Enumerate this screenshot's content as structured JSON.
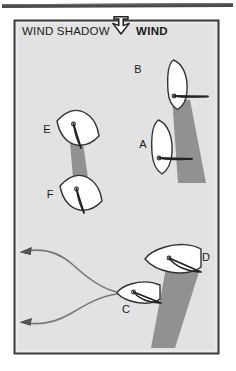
{
  "figure": {
    "kind": "sailing-wind-shadow-diagram",
    "header": {
      "wind_shadow_label": "WIND SHADOW",
      "wind_label": "WIND",
      "wind_arrow_icon": "arrow-down-icon",
      "wind_direction": "down"
    },
    "colors": {
      "panel_background": "#e2e2e2",
      "panel_border": "#3b3b3b",
      "top_rule": "#4a4a4a",
      "hull_fill": "#ffffff",
      "hull_stroke": "#333333",
      "shadow_fill": "#8c8c8c",
      "label_color": "#1a1a1a",
      "track_stroke": "#777777"
    },
    "boats": [
      {
        "id": "boat-b",
        "label": "B",
        "label_x": 138,
        "label_y": 73,
        "heading": "down",
        "has_shadow": true,
        "shadow_direction": "down-right"
      },
      {
        "id": "boat-a",
        "label": "A",
        "label_x": 143,
        "label_y": 148,
        "heading": "down",
        "has_shadow": false,
        "shadow_direction": "none"
      },
      {
        "id": "boat-e",
        "label": "E",
        "label_x": 47,
        "label_y": 133,
        "heading": "up-right-tilted",
        "has_shadow": true,
        "shadow_direction": "down"
      },
      {
        "id": "boat-f",
        "label": "F",
        "label_x": 50,
        "label_y": 198,
        "heading": "up-right-tilted",
        "has_shadow": false,
        "shadow_direction": "none"
      },
      {
        "id": "boat-d",
        "label": "D",
        "label_x": 206,
        "label_y": 261,
        "heading": "left",
        "has_shadow": true,
        "shadow_direction": "down-left"
      },
      {
        "id": "boat-c",
        "label": "C",
        "label_x": 126,
        "label_y": 313,
        "heading": "left",
        "has_shadow": false,
        "shadow_direction": "none"
      }
    ],
    "tracks": [
      {
        "id": "track-upper",
        "arrow_icon": "arrow-left-icon",
        "from": "boat-c",
        "to": "upper-left"
      },
      {
        "id": "track-lower",
        "arrow_icon": "arrow-left-icon",
        "from": "boat-c",
        "to": "lower-left"
      }
    ]
  }
}
